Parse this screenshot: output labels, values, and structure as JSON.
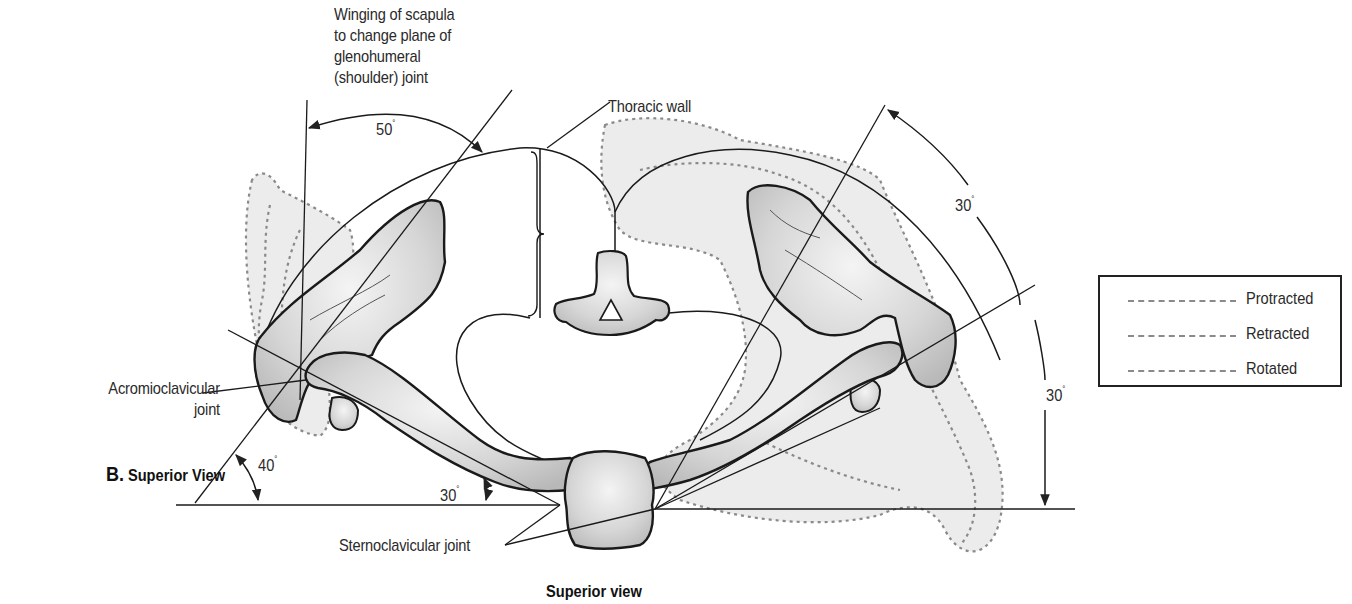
{
  "figure": {
    "panel_letter": "B.",
    "panel_title": "Superior View",
    "caption": "Superior view"
  },
  "labels": {
    "winging": [
      "Winging of scapula",
      "to change plane of",
      "glenohumeral",
      "(shoulder) joint"
    ],
    "thoracic_wall": "Thoracic wall",
    "acromioclavicular": [
      "Acromioclavicular",
      "joint"
    ],
    "sternoclavicular": "Sternoclavicular joint"
  },
  "angles": {
    "winging_angle": "50",
    "left_scapula_angle": "40",
    "clavicle_angle": "30",
    "right_upper_angle": "30",
    "right_lower_angle": "30",
    "degree_symbol": "°"
  },
  "legend": {
    "items": [
      {
        "label": "Protracted",
        "color": "#8a8a8a"
      },
      {
        "label": "Retracted",
        "color": "#8a8a8a"
      },
      {
        "label": "Rotated",
        "color": "#8a8a8a"
      }
    ]
  },
  "colors": {
    "bone_fill": "#d9d9d9",
    "shade_fill": "#ececec",
    "outline": "#1a1a1a",
    "dashed": "#8a8a8a"
  }
}
